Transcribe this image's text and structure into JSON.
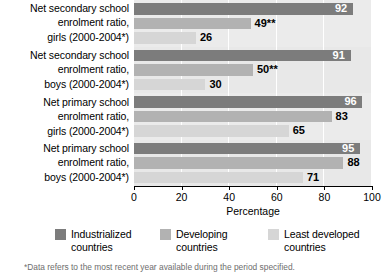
{
  "chart_data": {
    "type": "bar",
    "orientation": "horizontal",
    "title": "",
    "xlabel": "Percentage",
    "ylabel": "",
    "xlim": [
      0,
      100
    ],
    "xticks": [
      0,
      20,
      40,
      60,
      80,
      100
    ],
    "grid": true,
    "legend_position": "bottom",
    "categories": [
      "Net secondary school enrolment ratio, girls (2000-2004*)",
      "Net secondary school enrolment ratio, boys (2000-2004*)",
      "Net primary school enrolment ratio, girls (2000-2004*)",
      "Net primary school enrolment ratio, boys (2000-2004*)"
    ],
    "series": [
      {
        "name": "Industrialized countries",
        "color": "#7c7c7c",
        "values": [
          92,
          91,
          96,
          95
        ]
      },
      {
        "name": "Developing countries",
        "color": "#b2b2b2",
        "values": [
          49,
          50,
          83,
          88
        ]
      },
      {
        "name": "Least developed countries",
        "color": "#d6d6d6",
        "values": [
          26,
          30,
          65,
          71
        ]
      }
    ],
    "value_labels": [
      [
        "92",
        "49**",
        "26"
      ],
      [
        "91",
        "50**",
        "30"
      ],
      [
        "96",
        "83",
        "65"
      ],
      [
        "95",
        "88",
        "71"
      ]
    ]
  },
  "category_labels": [
    {
      "line1": "Net secondary school",
      "line2": "enrolment ratio,",
      "line3": "girls (2000-2004*)"
    },
    {
      "line1": "Net secondary school",
      "line2": "enrolment ratio,",
      "line3": "boys (2000-2004*)"
    },
    {
      "line1": "Net primary school",
      "line2": "enrolment ratio,",
      "line3": "girls (2000-2004*)"
    },
    {
      "line1": "Net primary school",
      "line2": "enrolment ratio,",
      "line3": "boys (2000-2004*)"
    }
  ],
  "axis": {
    "title": "Percentage",
    "tick_labels": [
      "0",
      "20",
      "40",
      "60",
      "80",
      "100"
    ]
  },
  "legend": {
    "items": [
      {
        "label": "Industrialized\ncountries",
        "color": "#7c7c7c"
      },
      {
        "label": "Developing\ncountries",
        "color": "#b2b2b2"
      },
      {
        "label": "Least developed\ncountries",
        "color": "#d6d6d6"
      }
    ]
  },
  "footnote": "*Data refers to the most recent year available during the period specified."
}
